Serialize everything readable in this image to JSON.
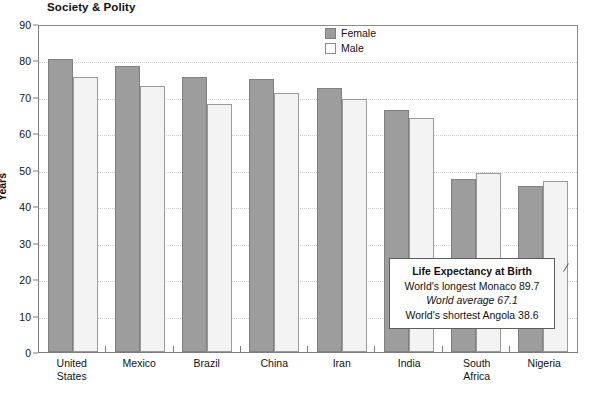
{
  "header": {
    "title": "Society & Polity"
  },
  "legend": {
    "position": "top-center-right",
    "items": [
      {
        "label": "Female",
        "color": "#9d9d9d"
      },
      {
        "label": "Male",
        "color": "#ffffff"
      }
    ]
  },
  "callout": {
    "title": "Life Expectancy at Birth",
    "line1": "World's longest Monaco 89.7",
    "line2": "World average 67.1",
    "line3": "World's shortest Angola 38.6"
  },
  "chart_data": {
    "type": "bar",
    "title": "Society & Polity",
    "xlabel": "",
    "ylabel": "Years",
    "ylim": [
      0,
      90
    ],
    "yticks": [
      0,
      10,
      20,
      30,
      40,
      50,
      60,
      70,
      80,
      90
    ],
    "grid": true,
    "categories": [
      "United States",
      "Mexico",
      "Brazil",
      "China",
      "Iran",
      "India",
      "South Africa",
      "Nigeria"
    ],
    "category_lines": [
      [
        "United",
        "States"
      ],
      [
        "Mexico"
      ],
      [
        "Brazil"
      ],
      [
        "China"
      ],
      [
        "Iran"
      ],
      [
        "India"
      ],
      [
        "South",
        "Africa"
      ],
      [
        "Nigeria"
      ]
    ],
    "series": [
      {
        "name": "Female",
        "color": "#9d9d9d",
        "values": [
          80.5,
          78.5,
          75.5,
          75.0,
          72.5,
          66.5,
          47.5,
          45.5
        ]
      },
      {
        "name": "Male",
        "color": "#f3f3f3",
        "values": [
          75.5,
          73.0,
          68.0,
          71.0,
          69.5,
          64.3,
          49.0,
          47.0
        ]
      }
    ],
    "annotations": [
      "Life Expectancy at Birth",
      "World's longest Monaco 89.7",
      "World average 67.1",
      "World's shortest Angola 38.6"
    ]
  }
}
